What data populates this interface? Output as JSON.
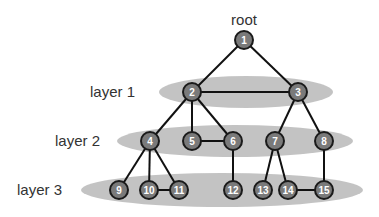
{
  "diagram": {
    "type": "layered-tree-graph",
    "root_label": "root",
    "colors": {
      "layer_ellipse": "#b8b8b8",
      "node_fill": "#7a7a7a",
      "node_stroke": "#1a1a1a",
      "edge": "#111111",
      "label_text": "#333333",
      "node_text": "#ffffff"
    },
    "layers": [
      {
        "label": "layer 1",
        "label_x": 90,
        "y": 92,
        "ellipse": {
          "cx": 246,
          "cy": 92,
          "rx": 87,
          "ry": 16
        }
      },
      {
        "label": "layer 2",
        "label_x": 55,
        "y": 141,
        "ellipse": {
          "cx": 235,
          "cy": 141,
          "rx": 118,
          "ry": 16
        }
      },
      {
        "label": "layer 3",
        "label_x": 17,
        "y": 190,
        "ellipse": {
          "cx": 222,
          "cy": 190,
          "rx": 141,
          "ry": 17
        }
      }
    ],
    "nodes": [
      {
        "id": "1",
        "x": 244,
        "y": 40
      },
      {
        "id": "2",
        "x": 192,
        "y": 92
      },
      {
        "id": "3",
        "x": 298,
        "y": 92
      },
      {
        "id": "4",
        "x": 150,
        "y": 141
      },
      {
        "id": "5",
        "x": 192,
        "y": 141
      },
      {
        "id": "6",
        "x": 233,
        "y": 141
      },
      {
        "id": "7",
        "x": 275,
        "y": 141
      },
      {
        "id": "8",
        "x": 324,
        "y": 141
      },
      {
        "id": "9",
        "x": 119,
        "y": 190
      },
      {
        "id": "10",
        "x": 149,
        "y": 190
      },
      {
        "id": "11",
        "x": 179,
        "y": 190
      },
      {
        "id": "12",
        "x": 233,
        "y": 190
      },
      {
        "id": "13",
        "x": 263,
        "y": 190
      },
      {
        "id": "14",
        "x": 288,
        "y": 190
      },
      {
        "id": "15",
        "x": 324,
        "y": 190
      }
    ],
    "edges": [
      [
        "1",
        "2"
      ],
      [
        "1",
        "3"
      ],
      [
        "2",
        "3"
      ],
      [
        "2",
        "4"
      ],
      [
        "2",
        "5"
      ],
      [
        "2",
        "6"
      ],
      [
        "5",
        "6"
      ],
      [
        "3",
        "7"
      ],
      [
        "3",
        "8"
      ],
      [
        "4",
        "9"
      ],
      [
        "4",
        "10"
      ],
      [
        "4",
        "11"
      ],
      [
        "10",
        "11"
      ],
      [
        "6",
        "12"
      ],
      [
        "7",
        "13"
      ],
      [
        "7",
        "14"
      ],
      [
        "14",
        "15"
      ],
      [
        "8",
        "15"
      ]
    ]
  }
}
